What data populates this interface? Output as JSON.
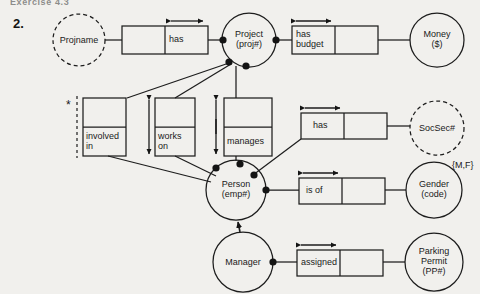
{
  "page": {
    "header_fragment": "Exercise 4.3",
    "question_number": "2.",
    "width": 480,
    "height": 294,
    "background": "#f1f0ed",
    "ink": "#1a1a1a"
  },
  "diagram": {
    "type": "conceptual-schema-er-diagram",
    "entities": [
      {
        "id": "projname",
        "label": "Projname",
        "shape": "circle",
        "outline": "dashed",
        "cx": 79,
        "cy": 40,
        "r": 26
      },
      {
        "id": "project",
        "label": "Project\n(proj#)",
        "shape": "circle",
        "outline": "solid",
        "cx": 249,
        "cy": 40,
        "r": 27
      },
      {
        "id": "money",
        "label": "Money\n($)",
        "shape": "circle",
        "outline": "solid",
        "cx": 437,
        "cy": 40,
        "r": 27
      },
      {
        "id": "socsec",
        "label": "SocSec#",
        "shape": "circle",
        "outline": "dashed",
        "cx": 437,
        "cy": 128,
        "r": 27
      },
      {
        "id": "gender",
        "label": "Gender\n(code)",
        "shape": "circle",
        "outline": "solid",
        "cx": 434,
        "cy": 190,
        "r": 28
      },
      {
        "id": "person",
        "label": "Person\n(emp#)",
        "shape": "circle",
        "outline": "solid",
        "cx": 236,
        "cy": 190,
        "r": 30
      },
      {
        "id": "manager",
        "label": "Manager",
        "shape": "circle",
        "outline": "solid",
        "cx": 243,
        "cy": 262,
        "r": 30
      },
      {
        "id": "parking",
        "label": "Parking\nPermit\n(PP#)",
        "shape": "circle",
        "outline": "solid",
        "cx": 434,
        "cy": 262,
        "r": 29
      }
    ],
    "fact_types": [
      {
        "id": "has-proj",
        "label": "has",
        "orientation": "horizontal",
        "x": 122,
        "y": 26,
        "w": 86,
        "h": 28,
        "arrow": "both",
        "arrow_side": "top",
        "arrow_span": "right-role"
      },
      {
        "id": "has-budget",
        "label": "has\nbudget",
        "orientation": "horizontal",
        "x": 292,
        "y": 26,
        "w": 86,
        "h": 28,
        "arrow": "both",
        "arrow_side": "top",
        "arrow_span": "left-role"
      },
      {
        "id": "involved-in",
        "label": "involved\nin",
        "orientation": "vertical",
        "x": 83,
        "y": 98,
        "w": 43,
        "h": 58,
        "arrow": "none",
        "constraint": "dashed-uniqueness-bar"
      },
      {
        "id": "works-on",
        "label": "works\non",
        "orientation": "vertical",
        "x": 155,
        "y": 98,
        "w": 40,
        "h": 58,
        "arrow": "both",
        "arrow_side": "left"
      },
      {
        "id": "manages",
        "label": "manages",
        "orientation": "vertical",
        "x": 224,
        "y": 98,
        "w": 48,
        "h": 58,
        "arrow": "both",
        "arrow_side": "left"
      },
      {
        "id": "has-socsec",
        "label": "has",
        "orientation": "horizontal",
        "x": 301,
        "y": 113,
        "w": 86,
        "h": 26,
        "arrow": "both",
        "arrow_side": "top",
        "arrow_span": "left-role"
      },
      {
        "id": "is-of",
        "label": "is of",
        "orientation": "horizontal",
        "x": 299,
        "y": 178,
        "w": 86,
        "h": 26,
        "arrow": "both",
        "arrow_side": "top",
        "arrow_span": "left-role"
      },
      {
        "id": "assigned",
        "label": "assigned",
        "orientation": "horizontal",
        "x": 297,
        "y": 250,
        "w": 86,
        "h": 26,
        "arrow": "both",
        "arrow_side": "top",
        "arrow_span": "left-role"
      }
    ],
    "annotations": [
      {
        "id": "value-constraint-gender",
        "label": "{M,F}",
        "x": 452,
        "y": 160
      },
      {
        "id": "frequency-asterisk",
        "label": "*",
        "x": 67,
        "y": 101
      }
    ],
    "subtype_links": [
      {
        "id": "manager-is-a-person",
        "from": "manager",
        "to": "person",
        "style": "solid-arrow-up"
      }
    ]
  }
}
